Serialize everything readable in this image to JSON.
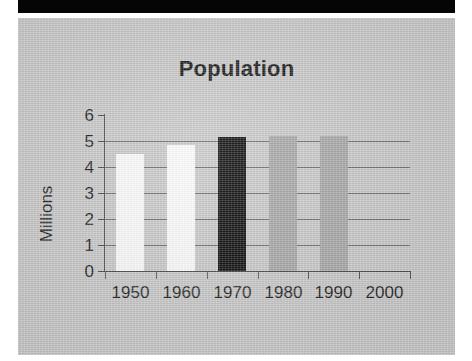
{
  "page": {
    "background_color": "#ffffff",
    "panel_color": "#c9c9c9",
    "band_color": "#050505"
  },
  "chart_data": {
    "type": "bar",
    "title": "Population",
    "xlabel": "",
    "ylabel": "Millions",
    "categories": [
      "1950",
      "1960",
      "1970",
      "1980",
      "1990",
      "2000"
    ],
    "values": [
      4.5,
      4.85,
      5.15,
      5.2,
      5.2,
      null
    ],
    "bar_colors": [
      "#fdfdfd",
      "#fdfdfd",
      "#080808",
      "#a6a6a6",
      "#a6a6a6",
      null
    ],
    "ylim": [
      0,
      6
    ],
    "ytick_labels": [
      "6",
      "5",
      "4",
      "3",
      "2",
      "1",
      "0"
    ],
    "ytick_values": [
      6,
      5,
      4,
      3,
      2,
      1,
      0
    ],
    "grid": true,
    "gridlines_at": [
      1,
      2,
      3,
      4,
      5
    ],
    "legend": null,
    "legend_position": "none"
  }
}
